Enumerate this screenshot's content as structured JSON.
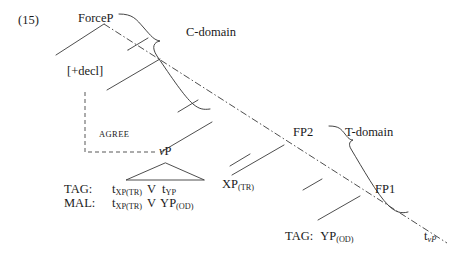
{
  "figure": {
    "example_number": "(15)",
    "domains": [
      {
        "id": "c-domain",
        "label": "C-domain"
      },
      {
        "id": "t-domain",
        "label": "T-domain"
      }
    ],
    "nodes": [
      {
        "id": "forcep",
        "label": "ForceP"
      },
      {
        "id": "decl",
        "label": "[+decl]"
      },
      {
        "id": "vp",
        "label_italic": "v",
        "label_rest": "P",
        "label": "vP"
      },
      {
        "id": "xp-tr",
        "label_main": "XP",
        "label_sub": "(TR)",
        "label": "XP(TR)"
      },
      {
        "id": "fp2",
        "label": "FP2"
      },
      {
        "id": "fp1",
        "label": "FP1"
      },
      {
        "id": "t-vp",
        "label_main": "t",
        "label_sub": "vP",
        "label": "t vP"
      }
    ],
    "relations": [
      {
        "id": "agree",
        "label": "AGREE"
      }
    ],
    "gloss_rows": [
      {
        "id": "tag-row",
        "label": "TAG:",
        "items": [
          {
            "main": "t",
            "sub": "XP(TR)"
          },
          {
            "main": "V",
            "sub": ""
          },
          {
            "main": "t",
            "sub": "YP"
          }
        ]
      },
      {
        "id": "mal-row",
        "label": "MAL:",
        "items": [
          {
            "main": "t",
            "sub": "XP(TR)"
          },
          {
            "main": "V",
            "sub": ""
          },
          {
            "main": "YP",
            "sub": "(OD)"
          }
        ]
      }
    ],
    "bottom_gloss": {
      "id": "tag-yp-row",
      "label": "TAG:",
      "main": "YP",
      "sub": "(OD)"
    },
    "colors": {
      "ink": "#1a1a1a",
      "line": "#3a3a3a",
      "background": "#ffffff"
    }
  }
}
